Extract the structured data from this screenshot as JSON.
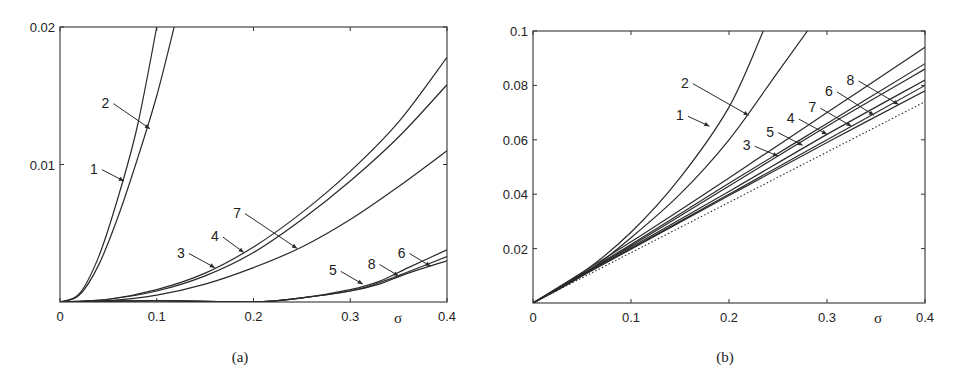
{
  "chart_data": [
    {
      "type": "line",
      "panel": "a",
      "caption": "(a)",
      "xlabel": "σ",
      "ylabel": "",
      "xlim": [
        0,
        0.4
      ],
      "ylim": [
        0,
        0.02
      ],
      "xticks": [
        "0",
        "0.1",
        "0.2",
        "0.3",
        "0.4"
      ],
      "yticks": [
        "0.01",
        "0.02"
      ],
      "grid": false,
      "series": [
        {
          "name": "1",
          "x": [
            0,
            0.02,
            0.04,
            0.06,
            0.08,
            0.1
          ],
          "y": [
            0,
            0.0006,
            0.0033,
            0.0076,
            0.0128,
            0.02
          ]
        },
        {
          "name": "2",
          "x": [
            0,
            0.02,
            0.04,
            0.06,
            0.08,
            0.1,
            0.118
          ],
          "y": [
            0,
            0.0005,
            0.0027,
            0.0062,
            0.0104,
            0.015,
            0.02
          ]
        },
        {
          "name": "3",
          "x": [
            0,
            0.05,
            0.1,
            0.15,
            0.2,
            0.25,
            0.3,
            0.35,
            0.4
          ],
          "y": [
            0,
            0.0002,
            0.0009,
            0.0021,
            0.004,
            0.0065,
            0.0095,
            0.0131,
            0.0178
          ]
        },
        {
          "name": "4",
          "x": [
            0,
            0.05,
            0.1,
            0.15,
            0.2,
            0.25,
            0.3,
            0.35,
            0.4
          ],
          "y": [
            0,
            0.0002,
            0.0008,
            0.0019,
            0.0036,
            0.006,
            0.0088,
            0.012,
            0.0158
          ]
        },
        {
          "name": "7",
          "x": [
            0,
            0.05,
            0.1,
            0.15,
            0.2,
            0.25,
            0.3,
            0.35,
            0.4
          ],
          "y": [
            0,
            0.0001,
            0.0005,
            0.0013,
            0.0025,
            0.004,
            0.006,
            0.0084,
            0.011
          ]
        },
        {
          "name": "5",
          "x": [
            0,
            0.1,
            0.2,
            0.25,
            0.3,
            0.33,
            0.36,
            0.4
          ],
          "y": [
            0,
            0.0001,
            0.0,
            0.0003,
            0.0008,
            0.0014,
            0.0022,
            0.0033
          ]
        },
        {
          "name": "6",
          "x": [
            0,
            0.1,
            0.2,
            0.25,
            0.3,
            0.33,
            0.36,
            0.4
          ],
          "y": [
            0,
            0.0001,
            0.0,
            0.0003,
            0.0008,
            0.0013,
            0.0021,
            0.003
          ]
        },
        {
          "name": "8",
          "x": [
            0,
            0.1,
            0.2,
            0.25,
            0.3,
            0.33,
            0.36,
            0.4
          ],
          "y": [
            0,
            0.0001,
            0.0,
            0.0003,
            0.0009,
            0.0015,
            0.0025,
            0.0038
          ]
        }
      ],
      "annotations": [
        {
          "label": "1",
          "text_pos": [
            0.035,
            0.0097
          ],
          "arrow_to": [
            0.066,
            0.0088
          ]
        },
        {
          "label": "2",
          "text_pos": [
            0.047,
            0.0145
          ],
          "arrow_to": [
            0.093,
            0.0126
          ]
        },
        {
          "label": "3",
          "text_pos": [
            0.125,
            0.0036
          ],
          "arrow_to": [
            0.16,
            0.0025
          ]
        },
        {
          "label": "4",
          "text_pos": [
            0.16,
            0.0048
          ],
          "arrow_to": [
            0.19,
            0.0036
          ]
        },
        {
          "label": "7",
          "text_pos": [
            0.183,
            0.0065
          ],
          "arrow_to": [
            0.245,
            0.0039
          ]
        },
        {
          "label": "5",
          "text_pos": [
            0.282,
            0.0023
          ],
          "arrow_to": [
            0.313,
            0.0013
          ]
        },
        {
          "label": "8",
          "text_pos": [
            0.322,
            0.0028
          ],
          "arrow_to": [
            0.35,
            0.0019
          ]
        },
        {
          "label": "6",
          "text_pos": [
            0.353,
            0.0036
          ],
          "arrow_to": [
            0.383,
            0.0026
          ]
        }
      ]
    },
    {
      "type": "line",
      "panel": "b",
      "caption": "(b)",
      "xlabel": "σ",
      "ylabel": "",
      "xlim": [
        0,
        0.4
      ],
      "ylim": [
        0,
        0.1
      ],
      "xticks": [
        "0",
        "0.1",
        "0.2",
        "0.3",
        "0.4"
      ],
      "yticks": [
        "0.02",
        "0.04",
        "0.06",
        "0.08",
        "0.1"
      ],
      "grid": false,
      "series": [
        {
          "name": "1",
          "x": [
            0,
            0.05,
            0.1,
            0.15,
            0.2,
            0.235
          ],
          "y": [
            0,
            0.011,
            0.026,
            0.046,
            0.072,
            0.1
          ]
        },
        {
          "name": "2",
          "x": [
            0,
            0.05,
            0.1,
            0.15,
            0.2,
            0.25,
            0.28
          ],
          "y": [
            0,
            0.01,
            0.024,
            0.04,
            0.06,
            0.085,
            0.1
          ]
        },
        {
          "name": "3",
          "x": [
            0,
            0.1,
            0.2,
            0.3,
            0.4
          ],
          "y": [
            0,
            0.0225,
            0.046,
            0.07,
            0.094
          ]
        },
        {
          "name": "5",
          "x": [
            0,
            0.1,
            0.2,
            0.3,
            0.4
          ],
          "y": [
            0,
            0.0215,
            0.044,
            0.066,
            0.088
          ]
        },
        {
          "name": "4",
          "x": [
            0,
            0.1,
            0.2,
            0.3,
            0.4
          ],
          "y": [
            0,
            0.021,
            0.043,
            0.065,
            0.086
          ]
        },
        {
          "name": "7",
          "x": [
            0,
            0.1,
            0.2,
            0.3,
            0.4
          ],
          "y": [
            0,
            0.0205,
            0.041,
            0.062,
            0.082
          ]
        },
        {
          "name": "6",
          "x": [
            0,
            0.1,
            0.2,
            0.3,
            0.4
          ],
          "y": [
            0,
            0.02,
            0.04,
            0.06,
            0.08
          ]
        },
        {
          "name": "8",
          "x": [
            0,
            0.1,
            0.2,
            0.3,
            0.4
          ],
          "y": [
            0,
            0.0198,
            0.0395,
            0.059,
            0.078
          ]
        },
        {
          "name": "reference (dotted)",
          "style": "dotted",
          "x": [
            0,
            0.4
          ],
          "y": [
            0,
            0.074
          ]
        }
      ],
      "annotations": [
        {
          "label": "1",
          "text_pos": [
            0.15,
            0.069
          ],
          "arrow_to": [
            0.18,
            0.065
          ]
        },
        {
          "label": "2",
          "text_pos": [
            0.155,
            0.081
          ],
          "arrow_to": [
            0.22,
            0.069
          ]
        },
        {
          "label": "3",
          "text_pos": [
            0.218,
            0.058
          ],
          "arrow_to": [
            0.25,
            0.054
          ]
        },
        {
          "label": "5",
          "text_pos": [
            0.242,
            0.063
          ],
          "arrow_to": [
            0.275,
            0.058
          ]
        },
        {
          "label": "4",
          "text_pos": [
            0.263,
            0.068
          ],
          "arrow_to": [
            0.3,
            0.062
          ]
        },
        {
          "label": "7",
          "text_pos": [
            0.285,
            0.072
          ],
          "arrow_to": [
            0.325,
            0.065
          ]
        },
        {
          "label": "6",
          "text_pos": [
            0.302,
            0.078
          ],
          "arrow_to": [
            0.348,
            0.069
          ]
        },
        {
          "label": "8",
          "text_pos": [
            0.324,
            0.082
          ],
          "arrow_to": [
            0.373,
            0.073
          ]
        }
      ]
    }
  ]
}
